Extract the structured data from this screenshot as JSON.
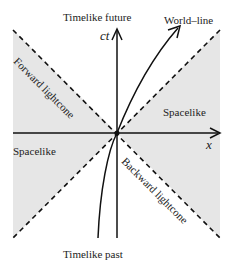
{
  "labels": {
    "timelike_future": "Timelike future",
    "timelike_past": "Timelike past",
    "world_line": "World–line",
    "spacelike_right": "Spacelike",
    "spacelike_left": "Spacelike",
    "forward_lightcone": "Forward lightcone",
    "backward_lightcone": "Backward lightcone",
    "axis_ct": "ct",
    "axis_x": "x"
  },
  "colors": {
    "shade": "#e6e6e6",
    "line": "#111111"
  }
}
